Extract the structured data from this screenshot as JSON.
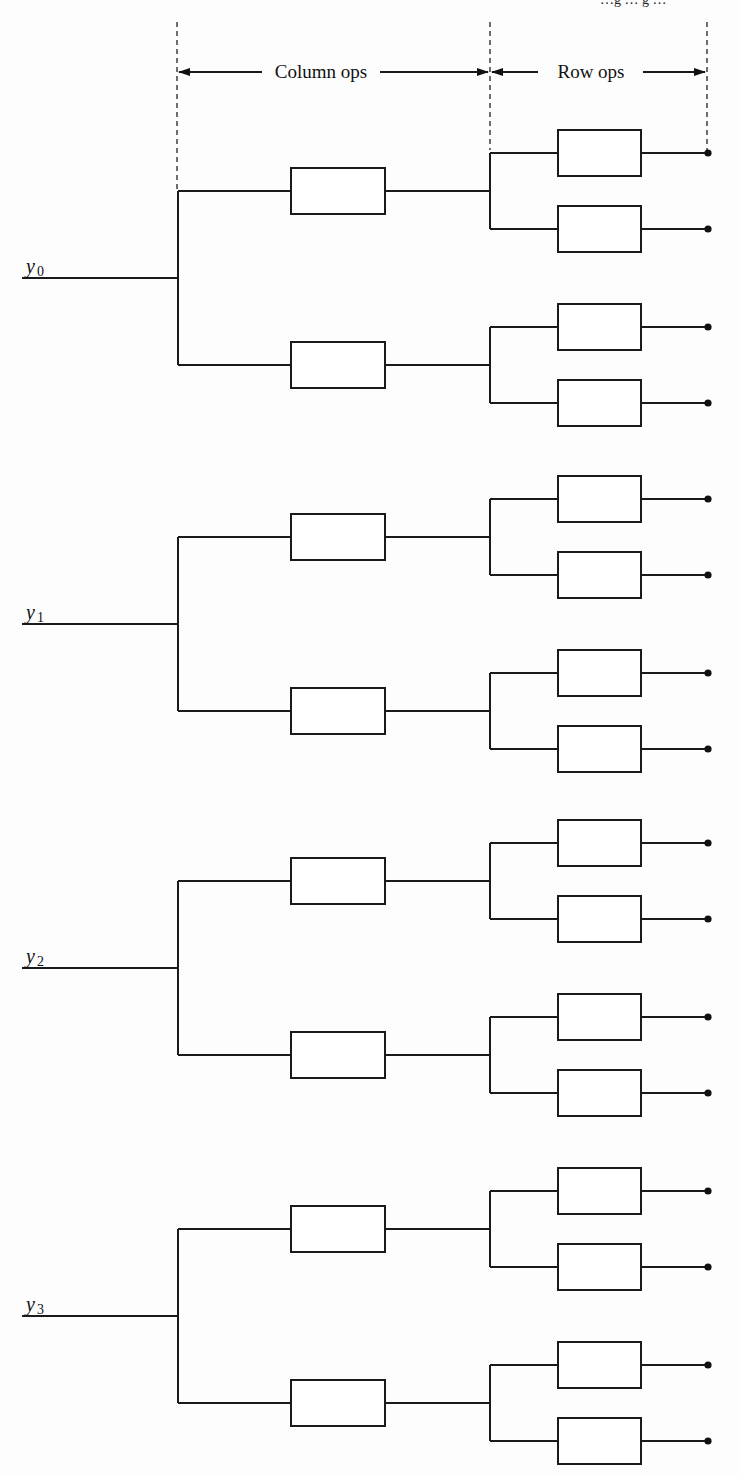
{
  "header": {
    "clipped_top_text": "…g … g …",
    "column_ops_label": "Column ops",
    "row_ops_label": "Row ops"
  },
  "inputs": [
    {
      "label": "y",
      "sub": "0"
    },
    {
      "label": "y",
      "sub": "1"
    },
    {
      "label": "y",
      "sub": "2"
    },
    {
      "label": "y",
      "sub": "3"
    }
  ],
  "layout": {
    "input_line_y": [
      278,
      624,
      968,
      1316
    ],
    "boundary_x": [
      177,
      490,
      707
    ],
    "column_box": {
      "x": 291,
      "w": 94,
      "h": 46
    },
    "row_box": {
      "x": 558,
      "w": 83,
      "h": 46
    },
    "endpoint_x": 708
  },
  "colors": {
    "line": "#1a1a1a",
    "background": "#fdfdfd"
  }
}
